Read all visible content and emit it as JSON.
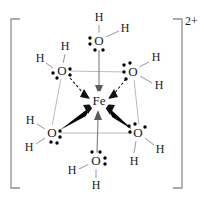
{
  "figure": {
    "charge_label": "2+",
    "center_atom": {
      "symbol": "Fe",
      "x": 99,
      "y": 101
    },
    "colors": {
      "atom_text": "#1a1a1a",
      "lone_pair": "#000000",
      "wedge_bond": "#000000",
      "dashed_bond": "#111111",
      "plain_bond": "#8a8a8a",
      "square_outline": "#a8a8a8",
      "bracket": "#8e8e8e",
      "background": "#ffffff"
    },
    "bracket": {
      "left_x": 11,
      "right_x": 182,
      "top_y": 19,
      "bottom_y": 188,
      "tick": 9
    },
    "ligands": [
      {
        "id": "water-top",
        "position": "axial-top",
        "oxygen": {
          "symbol": "O",
          "x": 99,
          "y": 41
        },
        "hydrogens": [
          {
            "symbol": "H",
            "x": 99,
            "y": 18
          },
          {
            "symbol": "H",
            "x": 125,
            "y": 29
          }
        ],
        "lone_pairs": [
          {
            "side": "left"
          },
          {
            "side": "bottom"
          }
        ],
        "bond_to_metal": "plain-arrow"
      },
      {
        "id": "water-upper-left",
        "position": "equatorial-back-left",
        "oxygen": {
          "symbol": "O",
          "x": 62,
          "y": 71
        },
        "hydrogens": [
          {
            "symbol": "H",
            "x": 65,
            "y": 47
          },
          {
            "symbol": "H",
            "x": 40,
            "y": 59
          }
        ],
        "lone_pairs": [
          {
            "side": "left"
          },
          {
            "side": "right"
          }
        ],
        "bond_to_metal": "dashed-arrow"
      },
      {
        "id": "water-upper-right",
        "position": "equatorial-back-right",
        "oxygen": {
          "symbol": "O",
          "x": 133,
          "y": 72
        },
        "hydrogens": [
          {
            "symbol": "H",
            "x": 156,
            "y": 58
          },
          {
            "symbol": "H",
            "x": 159,
            "y": 85
          }
        ],
        "lone_pairs": [
          {
            "side": "upper-left"
          },
          {
            "side": "lower-left"
          }
        ],
        "bond_to_metal": "dashed-arrow"
      },
      {
        "id": "water-lower-left",
        "position": "equatorial-front-left",
        "oxygen": {
          "symbol": "O",
          "x": 52,
          "y": 133
        },
        "hydrogens": [
          {
            "symbol": "H",
            "x": 30,
            "y": 121
          },
          {
            "symbol": "H",
            "x": 29,
            "y": 147
          }
        ],
        "lone_pairs": [
          {
            "side": "right"
          },
          {
            "side": "bottom"
          }
        ],
        "bond_to_metal": "bold-wedge-arrow"
      },
      {
        "id": "water-lower-right",
        "position": "equatorial-front-right",
        "oxygen": {
          "symbol": "O",
          "x": 138,
          "y": 133
        },
        "hydrogens": [
          {
            "symbol": "H",
            "x": 134,
            "y": 161
          },
          {
            "symbol": "H",
            "x": 160,
            "y": 149
          }
        ],
        "lone_pairs": [
          {
            "side": "upper-left"
          },
          {
            "side": "upper-right"
          }
        ],
        "bond_to_metal": "bold-wedge-arrow"
      },
      {
        "id": "water-bottom",
        "position": "axial-bottom",
        "oxygen": {
          "symbol": "O",
          "x": 96,
          "y": 161
        },
        "hydrogens": [
          {
            "symbol": "H",
            "x": 72,
            "y": 170
          },
          {
            "symbol": "H",
            "x": 96,
            "y": 185
          }
        ],
        "lone_pairs": [
          {
            "side": "top"
          },
          {
            "side": "right"
          }
        ],
        "bond_to_metal": "plain-arrow"
      }
    ],
    "labels": {
      "oxygen": "O",
      "hydrogen": "H",
      "iron": "Fe",
      "charge": "2+"
    }
  }
}
